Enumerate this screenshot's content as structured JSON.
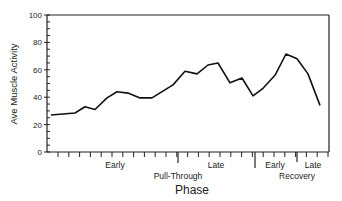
{
  "chart_data": {
    "type": "line",
    "title": "",
    "ylabel": "Ave Muscle Activity",
    "xlabel": "Phase",
    "ylim": [
      0,
      100
    ],
    "yticks": [
      0,
      20,
      40,
      60,
      80,
      100
    ],
    "grid": false,
    "legend": null,
    "phase_labels": [
      {
        "label": "Early",
        "group": "Pull-Through"
      },
      {
        "label": "Late",
        "group": "Pull-Through"
      },
      {
        "label": "Early",
        "group": "Recovery"
      },
      {
        "label": "Late",
        "group": "Recovery"
      }
    ],
    "group_labels": [
      "Pull-Through",
      "Recovery"
    ],
    "series": [
      {
        "name": "Ave Muscle Activity",
        "x_px": [
          51,
          75,
          85,
          95,
          107,
          117,
          128,
          140,
          152,
          173,
          185,
          197,
          208,
          218,
          230,
          242,
          253,
          263,
          275,
          286,
          297,
          308,
          320
        ],
        "values": [
          27,
          28.5,
          33,
          31,
          39.5,
          44,
          43,
          39.5,
          39.5,
          49,
          59,
          57,
          63.5,
          65,
          50.5,
          54,
          41,
          46.5,
          56,
          71.5,
          68,
          57,
          34
        ]
      }
    ]
  },
  "labels": {
    "y_axis": "Ave Muscle Activity",
    "x_axis": "Phase",
    "early_pull": "Early",
    "late_pull": "Late",
    "pull_through": "Pull-Through",
    "early_rec": "Early",
    "late_rec": "Late",
    "recovery": "Recovery",
    "y0": "0",
    "y20": "20",
    "y40": "40",
    "y60": "60",
    "y80": "80",
    "y100": "100"
  }
}
